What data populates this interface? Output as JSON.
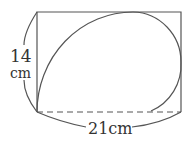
{
  "diagram": {
    "height_label_value": "14",
    "height_label_unit": "cm",
    "width_label": "21cm",
    "colors": {
      "stroke": "#555555",
      "text": "#333333"
    }
  }
}
